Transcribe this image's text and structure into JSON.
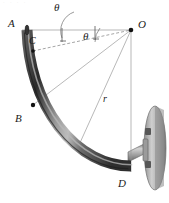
{
  "figure": {
    "title_fragment": "· · · ·",
    "labels": {
      "point_a": "A",
      "point_b": "B",
      "point_c": "C",
      "point_d": "D",
      "center_o": "O",
      "radius": "r",
      "angle_1": "θ",
      "angle_2": "θ"
    },
    "colors": {
      "tube_dark": "#2b2b2b",
      "tube_mid": "#6e6e6e",
      "tube_highlight": "#c9c9c9",
      "line": "#8c8c8c",
      "wall_plate": "#a9a9a9",
      "wall_plate_edge": "#6b6b6b",
      "label_text": "#1a1a1a"
    },
    "geometry": {
      "center_o": [
        131,
        30
      ],
      "point_a": [
        22,
        30
      ],
      "point_b": [
        33,
        105
      ],
      "point_c": [
        33,
        48
      ],
      "point_d": [
        124,
        172
      ],
      "radius_px": 109
    }
  }
}
